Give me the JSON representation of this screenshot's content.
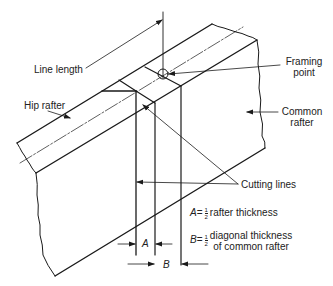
{
  "diagram": {
    "labels": {
      "line_length": "Line length",
      "hip_rafter": "Hip rafter",
      "framing_point_1": "Framing",
      "framing_point_2": "point",
      "common_rafter_1": "Common",
      "common_rafter_2": "rafter",
      "cutting_lines": "Cutting lines",
      "dim_a": "A",
      "dim_b": "B"
    },
    "legend": {
      "a_symbol": "A",
      "a_eq": "=",
      "a_frac_num": "1",
      "a_frac_den": "2",
      "a_text": "rafter thickness",
      "b_symbol": "B",
      "b_eq": "=",
      "b_frac_num": "1",
      "b_frac_den": "2",
      "b_text_1": "diagonal thickness",
      "b_text_2": "of common rafter"
    },
    "colors": {
      "line": "#1a1a1a",
      "background": "#ffffff"
    }
  }
}
